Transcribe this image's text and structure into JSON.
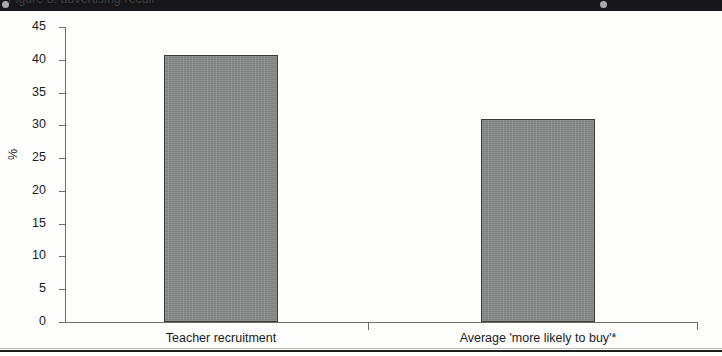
{
  "figure": {
    "banner_text": "Figure 8: advertising recall",
    "bottom_rule": true
  },
  "chart_data": {
    "type": "bar",
    "title": "",
    "subtitle": "",
    "xlabel": "",
    "ylabel": "%",
    "categories": [
      "Teacher recruitment",
      "Average 'more likely to buy'*"
    ],
    "values": [
      40.7,
      30.9
    ],
    "ylim": [
      0,
      45
    ],
    "ytick_step": 5,
    "yticks": [
      45,
      40,
      35,
      30,
      25,
      20,
      15,
      10,
      5,
      0
    ],
    "ytick_labels": [
      "45",
      "40",
      "35",
      "30",
      "25",
      "20",
      "15",
      "10",
      "5",
      "0"
    ],
    "grid": false,
    "legend": false,
    "legend_position": "none",
    "series": [
      {
        "name": "",
        "values": [
          40.7,
          30.9
        ],
        "color": "#8a8c8c",
        "edge_color": "#3a3a3a"
      }
    ],
    "annotations": []
  }
}
